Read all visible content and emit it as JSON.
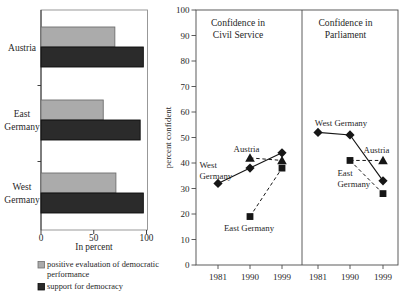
{
  "figure": {
    "background": "#ffffff",
    "text_color": "#1f1f1f",
    "ink_color": "#161616",
    "frame_color": "#4a4a4a"
  },
  "chart_data": [
    {
      "type": "bar",
      "orientation": "horizontal",
      "xlabel": "In percent",
      "xlim": [
        0,
        100
      ],
      "x_ticks": [
        0,
        50,
        100
      ],
      "grid": false,
      "legend_position": "below",
      "categories": [
        "Austria",
        "East Germany",
        "West Germany"
      ],
      "series": [
        {
          "name": "positive evaluation of democratic performance",
          "legend_lines": [
            "positive evaluation of democratic",
            "performance"
          ],
          "color": "#ababab",
          "border_color": "#6f6f6f",
          "values": [
            70,
            59,
            71
          ]
        },
        {
          "name": "support for democracy",
          "legend_lines": [
            "support for democracy"
          ],
          "color": "#2b2b2b",
          "border_color": "#0d0d0d",
          "values": [
            97,
            94,
            97
          ]
        }
      ]
    },
    {
      "type": "line",
      "ylabel": "percent confident",
      "ylim": [
        0,
        100
      ],
      "y_ticks": [
        0,
        10,
        20,
        30,
        40,
        50,
        60,
        70,
        80,
        90,
        100
      ],
      "grid": false,
      "legend_position": "none",
      "panels": [
        {
          "title_lines": [
            "Confidence in",
            "Civil Service"
          ],
          "x_ticks": [
            "1981",
            "1990",
            "1999"
          ],
          "series": [
            {
              "name": "West Germany",
              "label_lines": [
                "West",
                "Germany"
              ],
              "marker": "diamond",
              "line": "solid",
              "points": [
                {
                  "x": "1981",
                  "y": 32,
                  "show_marker": true
                },
                {
                  "x": "1990",
                  "y": 38,
                  "show_marker": true
                },
                {
                  "x": "1999",
                  "y": 44,
                  "show_marker": true
                }
              ]
            },
            {
              "name": "Austria",
              "label_lines": [
                "Austria"
              ],
              "marker": "triangle",
              "line": "dashed",
              "points": [
                {
                  "x": "1990",
                  "y": 42,
                  "show_marker": true
                },
                {
                  "x": "1999",
                  "y": 41,
                  "show_marker": true
                }
              ]
            },
            {
              "name": "East Germany",
              "label_lines": [
                "East Germany"
              ],
              "marker": "square",
              "line": "dashed",
              "points": [
                {
                  "x": "1990",
                  "y": 19,
                  "show_marker": true
                },
                {
                  "x": "1999",
                  "y": 38,
                  "show_marker": true
                }
              ]
            }
          ]
        },
        {
          "title_lines": [
            "Confidence in",
            "Parliament"
          ],
          "x_ticks": [
            "1981",
            "1990",
            "1999"
          ],
          "series": [
            {
              "name": "West Germany",
              "label_lines": [
                "West Germany"
              ],
              "marker": "diamond",
              "line": "solid",
              "points": [
                {
                  "x": "1981",
                  "y": 52,
                  "show_marker": true
                },
                {
                  "x": "1990",
                  "y": 51,
                  "show_marker": true
                },
                {
                  "x": "1999",
                  "y": 33,
                  "show_marker": true
                }
              ]
            },
            {
              "name": "Austria",
              "label_lines": [
                "Austria"
              ],
              "marker": "triangle",
              "line": "dashed",
              "points": [
                {
                  "x": "1990",
                  "y": 41,
                  "show_marker": false
                },
                {
                  "x": "1999",
                  "y": 41,
                  "show_marker": true
                }
              ]
            },
            {
              "name": "East Germany",
              "label_lines": [
                "East",
                "Germany"
              ],
              "marker": "square",
              "line": "dashed",
              "points": [
                {
                  "x": "1990",
                  "y": 41,
                  "show_marker": true
                },
                {
                  "x": "1999",
                  "y": 28,
                  "show_marker": true
                }
              ]
            }
          ]
        }
      ]
    }
  ]
}
